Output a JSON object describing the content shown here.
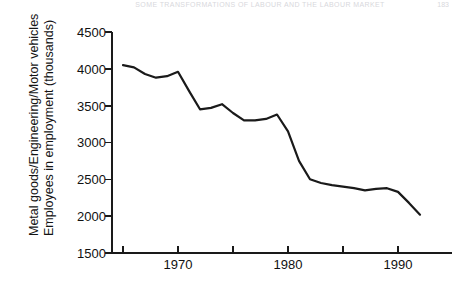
{
  "page": {
    "running_head": "SOME TRANSFORMATIONS OF LABOUR AND THE LABOUR MARKET",
    "folio": "183"
  },
  "chart_data": {
    "type": "line",
    "title": "",
    "subtitle": "",
    "xlabel": "",
    "ylabel_line1": "Metal goods/Engineering/Motor vehicles",
    "ylabel_line2": "Employees in employment (thousands)",
    "ylabel": "Metal goods/Engineering/Motor vehicles Employees in employment (thousands)",
    "xlim": [
      1964,
      1993
    ],
    "ylim": [
      1500,
      4500
    ],
    "ytick_values": [
      1500,
      2000,
      2500,
      3000,
      3500,
      4000,
      4500
    ],
    "ytick_labels": [
      "1500",
      "2000",
      "2500",
      "3000",
      "3500",
      "4000",
      "4500"
    ],
    "xtick_values": [
      1965,
      1970,
      1975,
      1980,
      1985,
      1990
    ],
    "xtick_labels": [
      "",
      "1970",
      "",
      "1980",
      "",
      "1990"
    ],
    "xtick_labels_shown": [
      "1970",
      "1980",
      "1990"
    ],
    "grid": false,
    "legend": null,
    "series": [
      {
        "name": "Employees in employment",
        "color": "#1a1a1a",
        "x": [
          1965,
          1966,
          1967,
          1968,
          1969,
          1970,
          1971,
          1972,
          1973,
          1974,
          1975,
          1976,
          1977,
          1978,
          1979,
          1980,
          1981,
          1982,
          1983,
          1984,
          1985,
          1986,
          1987,
          1988,
          1989,
          1990,
          1991,
          1992
        ],
        "values": [
          4050,
          4020,
          3930,
          3880,
          3900,
          3960,
          3700,
          3450,
          3470,
          3520,
          3400,
          3300,
          3300,
          3320,
          3380,
          3150,
          2750,
          2500,
          2450,
          2420,
          2400,
          2380,
          2350,
          2370,
          2380,
          2330,
          2180,
          2020
        ]
      }
    ]
  }
}
